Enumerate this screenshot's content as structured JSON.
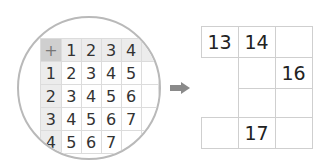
{
  "addition_table": {
    "operator": "+",
    "column_headers": [
      "1",
      "2",
      "3",
      "4"
    ],
    "rows": [
      {
        "header": "1",
        "values": [
          "2",
          "3",
          "4",
          "5"
        ]
      },
      {
        "header": "2",
        "values": [
          "3",
          "4",
          "5",
          "6"
        ]
      },
      {
        "header": "3",
        "values": [
          "4",
          "5",
          "6",
          "7"
        ]
      },
      {
        "header": "4",
        "values": [
          "5",
          "6",
          "7",
          ""
        ]
      }
    ]
  },
  "arrow": {
    "icon": "right-arrow-icon",
    "color": "#8a8a8a"
  },
  "puzzle_grid": {
    "cells": [
      {
        "row": 0,
        "col": 0,
        "value": "13"
      },
      {
        "row": 0,
        "col": 1,
        "value": "14"
      },
      {
        "row": 0,
        "col": 2,
        "value": ""
      },
      {
        "row": 1,
        "col": 1,
        "value": ""
      },
      {
        "row": 1,
        "col": 2,
        "value": "16"
      },
      {
        "row": 2,
        "col": 1,
        "value": ""
      },
      {
        "row": 2,
        "col": 2,
        "value": ""
      },
      {
        "row": 3,
        "col": 0,
        "value": ""
      },
      {
        "row": 3,
        "col": 1,
        "value": "17"
      },
      {
        "row": 3,
        "col": 2,
        "value": ""
      }
    ]
  }
}
